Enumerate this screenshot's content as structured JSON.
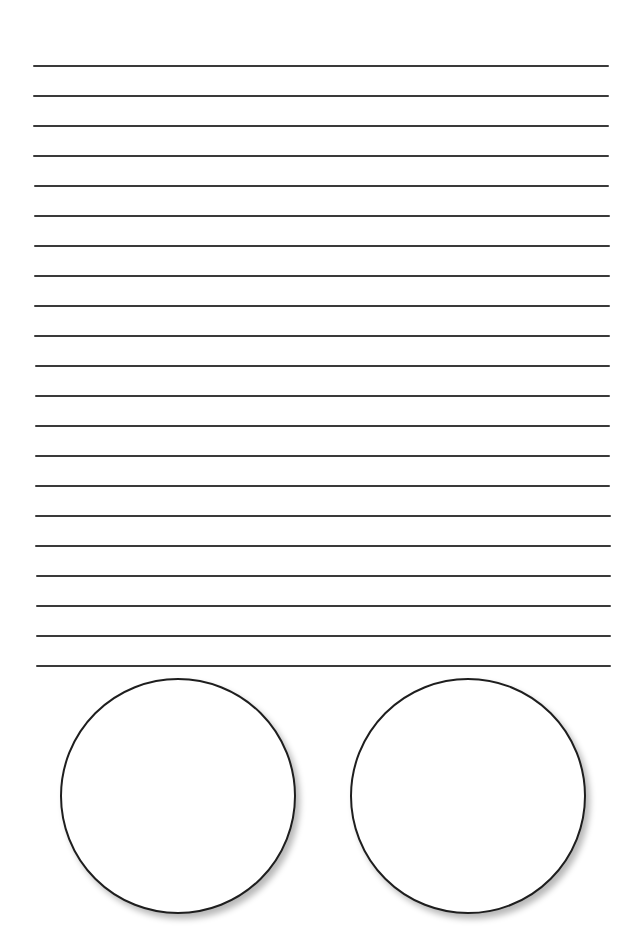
{
  "page": {
    "background": "#ffffff",
    "line_color": "#3a3a3a",
    "circle_stroke": "#1e1e1e"
  },
  "ruled_lines": {
    "count": 21,
    "first_y": 66,
    "spacing": 30,
    "left_top": 33,
    "left_bottom": 36,
    "right_top": 609,
    "right_bottom": 611
  },
  "circles": [
    {
      "name": "left-circle",
      "cx": 178,
      "cy": 796,
      "r": 118
    },
    {
      "name": "right-circle",
      "cx": 468,
      "cy": 796,
      "r": 118
    }
  ]
}
